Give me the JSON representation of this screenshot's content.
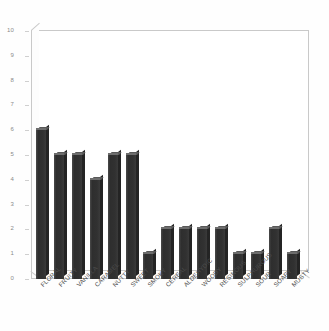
{
  "chart_data": {
    "type": "bar",
    "title": "",
    "subtitle": "",
    "xlabel": "",
    "ylabel": "",
    "ylim": [
      0,
      10
    ],
    "ytick_step": 1,
    "yticks": [
      "10",
      "9",
      "8",
      "7",
      "6",
      "5",
      "4",
      "3",
      "2",
      "1",
      "0"
    ],
    "grid": false,
    "legend": false,
    "legend_position": "none",
    "style": "3d-bars",
    "bar_color": "#333333",
    "categories": [
      "FLORAL",
      "FRUITY",
      "VANILLA",
      "CARAMEL",
      "NUTTY",
      "SWEET",
      "SMOKY",
      "CEREAL",
      "ALDEHYDIC",
      "WOODY",
      "RESINOUS",
      "SULPHUROUS",
      "SOUR",
      "SOAPY",
      "MUSTY"
    ],
    "values": [
      6,
      5,
      5,
      4,
      5,
      5,
      1,
      2,
      2,
      2,
      2,
      1,
      1,
      2,
      1
    ],
    "series": [
      {
        "name": "",
        "values": [
          6,
          5,
          5,
          4,
          5,
          5,
          1,
          2,
          2,
          2,
          2,
          1,
          1,
          2,
          1
        ]
      }
    ]
  },
  "figure": {
    "background_color": "#ffffff",
    "axis_color": "#c9c9c9",
    "tick_label_color": "#8a8a8a",
    "category_label_color": "#4b4b4b"
  }
}
